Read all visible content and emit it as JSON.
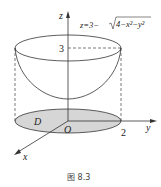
{
  "figure": {
    "equation": "z=3−√(4−x²−y²)",
    "equation_parts": {
      "prefix": "z=3−",
      "radicand": "4−x²−y²"
    },
    "axis_labels": {
      "z": "z",
      "y": "y",
      "x": "x",
      "origin": "O"
    },
    "tick_labels": {
      "z_height": "3",
      "radius": "2"
    },
    "region_label": "D",
    "caption": "图 8.3"
  },
  "colors": {
    "stroke": "#333333",
    "region_fill": "#d6d6d6",
    "dash": "#444444"
  }
}
